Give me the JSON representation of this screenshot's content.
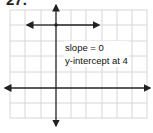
{
  "problem": {
    "number": "27."
  },
  "graph": {
    "grid": {
      "x_lines": [
        10,
        25,
        41,
        56,
        71,
        86,
        102,
        117,
        132,
        147
      ],
      "y_lines": [
        10,
        25,
        41,
        56,
        72,
        88,
        103,
        118
      ]
    },
    "axes": {
      "origin_px": [
        56,
        88
      ],
      "unit_px": 15.3
    },
    "line": {
      "equation": "y = 4",
      "y_value": 4,
      "x_from": -2,
      "x_to": 3
    }
  },
  "annotation": {
    "line1": "slope = 0",
    "line2": "y-intercept at 4"
  },
  "colors": {
    "grid": "#d6d6d6",
    "axis": "#222222",
    "line": "#222222"
  }
}
